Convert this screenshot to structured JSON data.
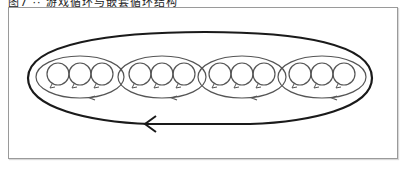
{
  "caption": {
    "text": "图7 ·· 游戏循环与嵌套循环结构"
  },
  "diagram": {
    "type": "nested-loops",
    "colors": {
      "frame_border": "#9a9a9a",
      "outer_loop": "#1a1a1a",
      "inner_loops": "#555555",
      "background": "#ffffff"
    },
    "outer_loop": {
      "label": "",
      "arrow_direction": "left",
      "contains_groups": 4
    },
    "groups": [
      {
        "id": 1,
        "small_loops": 3,
        "arrow_direction": "left"
      },
      {
        "id": 2,
        "small_loops": 3,
        "arrow_direction": "left"
      },
      {
        "id": 3,
        "small_loops": 3,
        "arrow_direction": "left"
      },
      {
        "id": 4,
        "small_loops": 3,
        "arrow_direction": "left"
      }
    ]
  }
}
